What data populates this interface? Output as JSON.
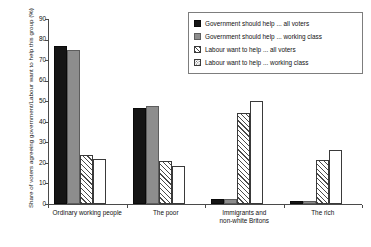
{
  "chart_data": {
    "type": "bar",
    "title": "",
    "xlabel": "",
    "ylabel": "Share of voters agreeing government/Labour want to help this group (%)",
    "ylim": [
      0,
      90
    ],
    "yticks": [
      0,
      10,
      20,
      30,
      40,
      50,
      60,
      70,
      80,
      90
    ],
    "grid": false,
    "legend_position": "top-right",
    "categories": [
      "Ordinary working people",
      "The poor",
      "Immigrants and non-white Britons",
      "The rich"
    ],
    "category_lines": [
      [
        "Ordinary working people"
      ],
      [
        "The poor"
      ],
      [
        "Immigrants and",
        "non-white Britons"
      ],
      [
        "The rich"
      ]
    ],
    "series": [
      {
        "name": "Government should help ... all voters",
        "pattern": "solid-black",
        "values": [
          77,
          46.5,
          2.5,
          1.5
        ]
      },
      {
        "name": "Government should help ... working class",
        "pattern": "solid-gray",
        "values": [
          75,
          47.5,
          2.5,
          1.5
        ]
      },
      {
        "name": "Labour want to help ... all voters",
        "pattern": "diagonal-hatch",
        "values": [
          24,
          21,
          44.5,
          21.5
        ]
      },
      {
        "name": "Labour want to help ... working class",
        "pattern": "dotted",
        "values": [
          22,
          18.5,
          50,
          26.5
        ]
      }
    ]
  }
}
